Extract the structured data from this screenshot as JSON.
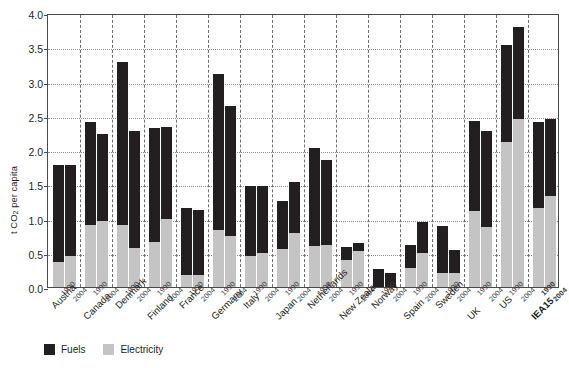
{
  "chart_data": {
    "type": "bar",
    "subtype": "stacked-grouped",
    "title": "",
    "xlabel": "",
    "ylabel": "t CO2 per capita",
    "ylabel_html": "t CO<sub>2</sub> per capita",
    "ylim": [
      0,
      4.0
    ],
    "ytick_step": 0.5,
    "yticks": [
      "0.0",
      "0.5",
      "1.0",
      "1.5",
      "2.0",
      "2.5",
      "3.0",
      "3.5",
      "4.0"
    ],
    "grid": true,
    "legend_position": "bottom-left",
    "legend": [
      {
        "name": "Fuels",
        "color": "#231f20"
      },
      {
        "name": "Electricity",
        "color": "#c4c4c4"
      }
    ],
    "series": [
      {
        "name": "Electricity",
        "color": "#c4c4c4"
      },
      {
        "name": "Fuels",
        "color": "#231f20"
      }
    ],
    "categories": [
      "Austria",
      "Canada",
      "Denmark",
      "Finland",
      "France",
      "Germany",
      "Italy",
      "Japan",
      "Netherlands",
      "New Zealand",
      "Norway",
      "Spain",
      "Sweden",
      "UK",
      "US",
      "IEA15"
    ],
    "sub_categories": [
      "1990",
      "2004"
    ],
    "highlight_category": "IEA15",
    "groups": [
      {
        "category": "Austria",
        "bold": false,
        "bars": [
          {
            "year": "1990",
            "electricity": 0.37,
            "fuels": 1.41,
            "total": 1.78
          },
          {
            "year": "2004",
            "electricity": 0.45,
            "fuels": 1.33,
            "total": 1.78
          }
        ]
      },
      {
        "category": "Canada",
        "bold": false,
        "bars": [
          {
            "year": "1990",
            "electricity": 0.91,
            "fuels": 1.5,
            "total": 2.41
          },
          {
            "year": "2004",
            "electricity": 0.97,
            "fuels": 1.27,
            "total": 2.24
          }
        ]
      },
      {
        "category": "Denmark",
        "bold": false,
        "bars": [
          {
            "year": "1990",
            "electricity": 0.91,
            "fuels": 2.37,
            "total": 3.28
          },
          {
            "year": "2004",
            "electricity": 0.57,
            "fuels": 1.71,
            "total": 2.28
          }
        ]
      },
      {
        "category": "Finland",
        "bold": false,
        "bars": [
          {
            "year": "1990",
            "electricity": 0.66,
            "fuels": 1.66,
            "total": 2.32
          },
          {
            "year": "2004",
            "electricity": 1.0,
            "fuels": 1.33,
            "total": 2.33
          }
        ]
      },
      {
        "category": "France",
        "bold": false,
        "bars": [
          {
            "year": "1990",
            "electricity": 0.17,
            "fuels": 0.98,
            "total": 1.15
          },
          {
            "year": "2004",
            "electricity": 0.18,
            "fuels": 0.94,
            "total": 1.12
          }
        ]
      },
      {
        "category": "Germany",
        "bold": false,
        "bars": [
          {
            "year": "1990",
            "electricity": 0.83,
            "fuels": 2.28,
            "total": 3.11
          },
          {
            "year": "2004",
            "electricity": 0.74,
            "fuels": 1.9,
            "total": 2.64
          }
        ]
      },
      {
        "category": "Italy",
        "bold": false,
        "bars": [
          {
            "year": "1990",
            "electricity": 0.45,
            "fuels": 1.03,
            "total": 1.48
          },
          {
            "year": "2004",
            "electricity": 0.49,
            "fuels": 0.99,
            "total": 1.48
          }
        ]
      },
      {
        "category": "Japan",
        "bold": false,
        "bars": [
          {
            "year": "1990",
            "electricity": 0.55,
            "fuels": 0.7,
            "total": 1.25
          },
          {
            "year": "2004",
            "electricity": 0.79,
            "fuels": 0.74,
            "total": 1.53
          }
        ]
      },
      {
        "category": "Netherlands",
        "bold": false,
        "bars": [
          {
            "year": "1990",
            "electricity": 0.6,
            "fuels": 1.43,
            "total": 2.03
          },
          {
            "year": "2004",
            "electricity": 0.62,
            "fuels": 1.24,
            "total": 1.86
          }
        ]
      },
      {
        "category": "New Zealand",
        "bold": false,
        "bars": [
          {
            "year": "1990",
            "electricity": 0.4,
            "fuels": 0.18,
            "total": 0.58
          },
          {
            "year": "2004",
            "electricity": 0.52,
            "fuels": 0.12,
            "total": 0.64
          }
        ]
      },
      {
        "category": "Norway",
        "bold": false,
        "bars": [
          {
            "year": "1990",
            "electricity": 0.0,
            "fuels": 0.27,
            "total": 0.27
          },
          {
            "year": "2004",
            "electricity": 0.0,
            "fuels": 0.21,
            "total": 0.21
          }
        ]
      },
      {
        "category": "Spain",
        "bold": false,
        "bars": [
          {
            "year": "1990",
            "electricity": 0.28,
            "fuels": 0.34,
            "total": 0.62
          },
          {
            "year": "2004",
            "electricity": 0.49,
            "fuels": 0.46,
            "total": 0.95
          }
        ]
      },
      {
        "category": "Sweden",
        "bold": false,
        "bars": [
          {
            "year": "1990",
            "electricity": 0.21,
            "fuels": 0.68,
            "total": 0.89
          },
          {
            "year": "2004",
            "electricity": 0.21,
            "fuels": 0.33,
            "total": 0.54
          }
        ]
      },
      {
        "category": "UK",
        "bold": false,
        "bars": [
          {
            "year": "1990",
            "electricity": 1.11,
            "fuels": 1.31,
            "total": 2.42
          },
          {
            "year": "2004",
            "electricity": 0.88,
            "fuels": 1.4,
            "total": 2.28
          }
        ]
      },
      {
        "category": "US",
        "bold": false,
        "bars": [
          {
            "year": "1990",
            "electricity": 2.11,
            "fuels": 1.43,
            "total": 3.54
          },
          {
            "year": "2004",
            "electricity": 2.46,
            "fuels": 1.33,
            "total": 3.79
          }
        ]
      },
      {
        "category": "IEA15",
        "bold": true,
        "bars": [
          {
            "year": "1990",
            "electricity": 1.16,
            "fuels": 1.25,
            "total": 2.41
          },
          {
            "year": "2004",
            "electricity": 1.33,
            "fuels": 1.12,
            "total": 2.45
          }
        ]
      }
    ]
  },
  "colors": {
    "fuels": "#231f20",
    "electricity": "#c4c4c4",
    "axis": "#4a4a4a",
    "grid": "#8d8d8d",
    "separator": "#6f6f6f",
    "background": "#ffffff"
  }
}
